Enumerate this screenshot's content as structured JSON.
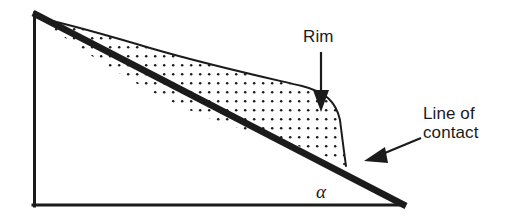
{
  "figure": {
    "type": "technical-line-diagram",
    "background_color": "#ffffff",
    "ink_color": "#1b1b1b",
    "labels": {
      "rim": "Rim",
      "line_of_contact_line1": "Line of",
      "line_of_contact_line2": "contact",
      "angle_symbol": "α"
    },
    "annotations": [
      {
        "name": "rim-annotation",
        "text": "Rim",
        "arrow_direction": "down",
        "arrow_from": [
          321,
          52
        ],
        "arrow_to": [
          321,
          110
        ]
      },
      {
        "name": "line-of-contact-annotation",
        "text": "Line of contact",
        "arrow_direction": "down-left",
        "arrow_from": [
          420,
          139
        ],
        "arrow_to": [
          366,
          161
        ]
      },
      {
        "name": "angle-label",
        "text": "α",
        "position": [
          323,
          193
        ],
        "meaning": "inclination angle at base vertex"
      }
    ],
    "geometry": {
      "apex": [
        33,
        13
      ],
      "bottom_left": [
        33,
        206
      ],
      "bottom_right": [
        406,
        207
      ],
      "hypotenuse_stroke_width": 6,
      "frame_stroke_width": 3,
      "deposit_fill": "stipple-dots",
      "deposit_right_edge_x": 347
    }
  }
}
